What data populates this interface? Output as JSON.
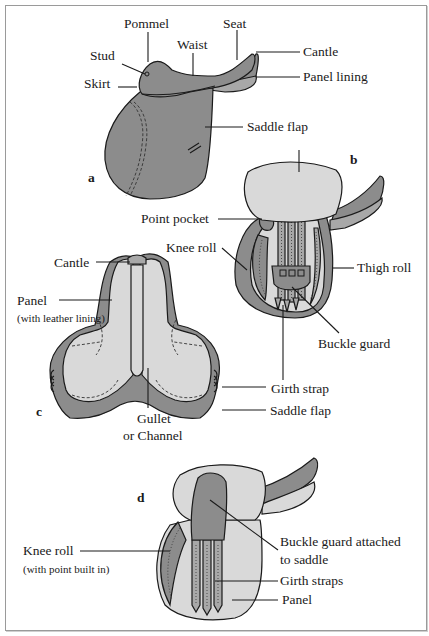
{
  "figure": {
    "panels": [
      {
        "id": "a",
        "letter": "a",
        "labels": {
          "pommel": "Pommel",
          "seat": "Seat",
          "waist": "Waist",
          "stud": "Stud",
          "cantle": "Cantle",
          "skirt": "Skirt",
          "panel_lining": "Panel lining",
          "saddle_flap": "Saddle flap"
        }
      },
      {
        "id": "b",
        "letter": "b",
        "labels": {
          "point_pocket": "Point pocket",
          "knee_roll": "Knee roll",
          "thigh_roll": "Thigh roll",
          "buckle_guard": "Buckle guard",
          "girth_strap": "Girth strap"
        }
      },
      {
        "id": "c",
        "letter": "c",
        "labels": {
          "cantle": "Cantle",
          "panel": "Panel",
          "panel_note": "(with leather lining)",
          "saddle_flap": "Saddle flap",
          "gullet_line1": "Gullet",
          "gullet_line2": "or Channel"
        }
      },
      {
        "id": "d",
        "letter": "d",
        "labels": {
          "buckle_guard_line1": "Buckle guard attached",
          "buckle_guard_line2": "to saddle",
          "knee_roll": "Knee roll",
          "knee_roll_note": "(with point built in)",
          "girth_straps": "Girth straps",
          "panel": "Panel"
        }
      }
    ],
    "colors": {
      "leather_dark": "#8c8c8c",
      "panel_light": "#d9d9d9",
      "outline": "#1a1a1a",
      "frame": "#9a9a9a"
    }
  }
}
